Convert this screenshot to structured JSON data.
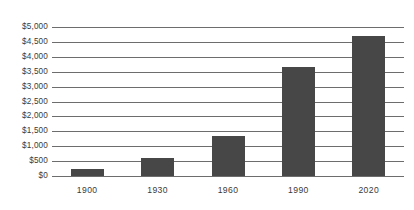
{
  "chart_data": {
    "type": "bar",
    "title": "",
    "subtitle": "",
    "xlabel": "",
    "ylabel": "",
    "categories": [
      "1900",
      "1930",
      "1960",
      "1990",
      "2020"
    ],
    "values": [
      220,
      620,
      1330,
      3650,
      4700
    ],
    "series": [
      {
        "name": "",
        "values": [
          220,
          620,
          1330,
          3650,
          4700
        ]
      }
    ],
    "ylim": [
      0,
      5000
    ],
    "ytick_values": [
      0,
      500,
      1000,
      1500,
      2000,
      2500,
      3000,
      3500,
      4000,
      4500,
      5000
    ],
    "ytick_labels": [
      "$0",
      "$500",
      "$1,000",
      "$1,500",
      "$2,000",
      "$2,500",
      "$3,000",
      "$3,500",
      "$4,000",
      "$4,500",
      "$5,000"
    ],
    "xtick_labels": [
      "1900",
      "1930",
      "1960",
      "1990",
      "2020"
    ],
    "grid": true,
    "grid_axis": "y",
    "legend": false,
    "legend_position": "none",
    "annotations": [],
    "colors": {
      "bar_fill": "#474747",
      "gridline": "#6d6d6d",
      "axis_line": "#6d6d6d",
      "tick_label": "#3a3a3a",
      "background": "#ffffff"
    }
  }
}
